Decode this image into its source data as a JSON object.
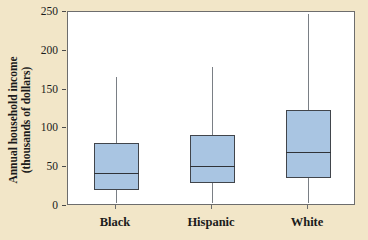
{
  "chart_data": {
    "type": "box",
    "title": "",
    "xlabel": "",
    "ylabel": "Annual household income (thousands of dollars)",
    "ylabel_line1": "Annual household income",
    "ylabel_line2": "(thousands of dollars)",
    "categories": [
      "Black",
      "Hispanic",
      "White"
    ],
    "ylim": [
      0,
      250
    ],
    "yticks": [
      0,
      50,
      100,
      150,
      200,
      250
    ],
    "ytick_labels": [
      "0",
      "50",
      "100",
      "150",
      "200",
      "250"
    ],
    "grid": false,
    "legend": "none",
    "box_fill_color": "#a9c5e2",
    "box_edge_color": "#41454b",
    "whisker_color": "#7a7f85",
    "background_color": "#f2e6c8",
    "plot_background_color": "#ffffff",
    "boxes": [
      {
        "label": "Black",
        "min": 4,
        "q1": 21,
        "median": 42,
        "q3": 81,
        "max": 166
      },
      {
        "label": "Hispanic",
        "min": 4,
        "q1": 29,
        "median": 52,
        "q3": 91,
        "max": 179
      },
      {
        "label": "White",
        "min": 4,
        "q1": 36,
        "median": 70,
        "q3": 124,
        "max": 248
      }
    ]
  }
}
